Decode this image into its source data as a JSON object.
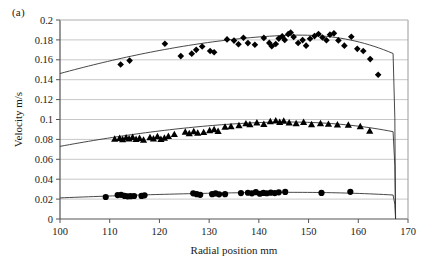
{
  "panel": {
    "label": "(a)"
  },
  "chart_data": {
    "type": "scatter",
    "title": "",
    "xlabel": "Radial position mm",
    "ylabel": "Velocity m/s",
    "xlim": [
      100,
      170
    ],
    "ylim": [
      0,
      0.2
    ],
    "xticks": [
      100,
      110,
      120,
      130,
      140,
      150,
      160,
      170
    ],
    "yticks": [
      0,
      0.02,
      0.04,
      0.06,
      0.08,
      0.1,
      0.12,
      0.14,
      0.16,
      0.18,
      0.2
    ],
    "xtick_labels": [
      "100",
      "110",
      "120",
      "130",
      "140",
      "150",
      "160",
      "170"
    ],
    "ytick_labels": [
      "0",
      "0.02",
      "0.04",
      "0.06",
      "0.08",
      "0.1",
      "0.12",
      "0.14",
      "0.16",
      "0.18",
      "0.2"
    ],
    "grid": "horizontal",
    "legend": "none",
    "marker_color": "#000000",
    "line_color": "#333333",
    "gridline_color": "#c8c8c8",
    "series": [
      {
        "name": "high-velocity-diamonds",
        "marker": "diamond",
        "points": [
          [
            112.2,
            0.1553
          ],
          [
            114.0,
            0.1592
          ],
          [
            121.1,
            0.1762
          ],
          [
            124.3,
            0.1637
          ],
          [
            126.5,
            0.1662
          ],
          [
            127.4,
            0.17
          ],
          [
            128.6,
            0.1733
          ],
          [
            130.2,
            0.1688
          ],
          [
            131.0,
            0.1676
          ],
          [
            133.6,
            0.1805
          ],
          [
            135.0,
            0.1793
          ],
          [
            135.9,
            0.1757
          ],
          [
            136.9,
            0.1821
          ],
          [
            137.8,
            0.1768
          ],
          [
            139.2,
            0.1752
          ],
          [
            141.0,
            0.182
          ],
          [
            142.1,
            0.177
          ],
          [
            142.6,
            0.1736
          ],
          [
            143.4,
            0.1759
          ],
          [
            144.0,
            0.1813
          ],
          [
            144.7,
            0.1836
          ],
          [
            145.2,
            0.18
          ],
          [
            145.9,
            0.1858
          ],
          [
            146.4,
            0.1874
          ],
          [
            147.0,
            0.183
          ],
          [
            147.9,
            0.1769
          ],
          [
            148.8,
            0.1798
          ],
          [
            149.5,
            0.1742
          ],
          [
            150.3,
            0.1812
          ],
          [
            151.2,
            0.1838
          ],
          [
            152.0,
            0.186
          ],
          [
            152.8,
            0.1824
          ],
          [
            153.6,
            0.1796
          ],
          [
            154.3,
            0.1853
          ],
          [
            155.1,
            0.1866
          ],
          [
            156.0,
            0.1795
          ],
          [
            157.2,
            0.1742
          ],
          [
            158.6,
            0.1832
          ],
          [
            159.8,
            0.171
          ],
          [
            161.0,
            0.1689
          ],
          [
            162.4,
            0.1607
          ],
          [
            164.0,
            0.145
          ]
        ],
        "fit": {
          "kind": "profile",
          "x_start": 100.0,
          "x_peak": 148.0,
          "y_start": 0.1462,
          "y_peak": 0.1848,
          "x_wall": 167.0,
          "y_wall_drop": 0.0
        }
      },
      {
        "name": "mid-velocity-triangles",
        "marker": "triangle",
        "points": [
          [
            111.0,
            0.0806
          ],
          [
            112.0,
            0.0812
          ],
          [
            112.6,
            0.08
          ],
          [
            113.3,
            0.0818
          ],
          [
            113.9,
            0.0808
          ],
          [
            114.6,
            0.0822
          ],
          [
            115.3,
            0.0803
          ],
          [
            116.0,
            0.0812
          ],
          [
            116.8,
            0.0795
          ],
          [
            118.1,
            0.082
          ],
          [
            118.8,
            0.0808
          ],
          [
            119.6,
            0.0831
          ],
          [
            120.3,
            0.0804
          ],
          [
            121.0,
            0.0816
          ],
          [
            121.8,
            0.0833
          ],
          [
            123.0,
            0.0852
          ],
          [
            125.2,
            0.0875
          ],
          [
            126.0,
            0.0861
          ],
          [
            126.9,
            0.088
          ],
          [
            127.7,
            0.0866
          ],
          [
            128.9,
            0.0872
          ],
          [
            130.1,
            0.0891
          ],
          [
            131.0,
            0.0902
          ],
          [
            131.8,
            0.0884
          ],
          [
            133.2,
            0.0925
          ],
          [
            134.4,
            0.0932
          ],
          [
            136.0,
            0.0941
          ],
          [
            137.4,
            0.096
          ],
          [
            138.2,
            0.0951
          ],
          [
            139.6,
            0.0968
          ],
          [
            141.0,
            0.0954
          ],
          [
            142.3,
            0.0982
          ],
          [
            143.4,
            0.099
          ],
          [
            144.2,
            0.0974
          ],
          [
            145.0,
            0.0986
          ],
          [
            146.1,
            0.0968
          ],
          [
            147.5,
            0.0962
          ],
          [
            149.0,
            0.0973
          ],
          [
            150.6,
            0.0951
          ],
          [
            152.4,
            0.0962
          ],
          [
            154.0,
            0.0955
          ],
          [
            155.8,
            0.0948
          ],
          [
            158.0,
            0.0946
          ],
          [
            160.4,
            0.093
          ],
          [
            162.3,
            0.0885
          ]
        ],
        "fit": {
          "kind": "profile",
          "x_start": 100.0,
          "x_peak": 145.0,
          "y_start": 0.073,
          "y_peak": 0.0975,
          "x_wall": 167.0,
          "y_wall_drop": 0.0
        }
      },
      {
        "name": "low-velocity-circles",
        "marker": "circle",
        "points": [
          [
            109.2,
            0.0221
          ],
          [
            111.6,
            0.024
          ],
          [
            112.3,
            0.0243
          ],
          [
            113.0,
            0.0232
          ],
          [
            113.6,
            0.0228
          ],
          [
            114.2,
            0.0229
          ],
          [
            114.9,
            0.0231
          ],
          [
            116.4,
            0.0232
          ],
          [
            117.0,
            0.0238
          ],
          [
            126.8,
            0.0258
          ],
          [
            127.5,
            0.025
          ],
          [
            128.2,
            0.0243
          ],
          [
            130.6,
            0.0249
          ],
          [
            131.3,
            0.0257
          ],
          [
            132.0,
            0.0248
          ],
          [
            133.2,
            0.0249
          ],
          [
            136.4,
            0.0261
          ],
          [
            137.8,
            0.0264
          ],
          [
            138.6,
            0.0258
          ],
          [
            139.4,
            0.027
          ],
          [
            140.2,
            0.0254
          ],
          [
            140.9,
            0.0262
          ],
          [
            141.6,
            0.0259
          ],
          [
            142.4,
            0.0265
          ],
          [
            143.2,
            0.0261
          ],
          [
            144.0,
            0.0268
          ],
          [
            145.3,
            0.0272
          ],
          [
            152.6,
            0.0262
          ],
          [
            158.4,
            0.0273
          ]
        ],
        "fit": {
          "kind": "profile",
          "x_start": 100.0,
          "x_peak": 146.0,
          "y_start": 0.0212,
          "y_peak": 0.0268,
          "x_wall": 167.0,
          "y_wall_drop": 0.0
        }
      }
    ]
  }
}
